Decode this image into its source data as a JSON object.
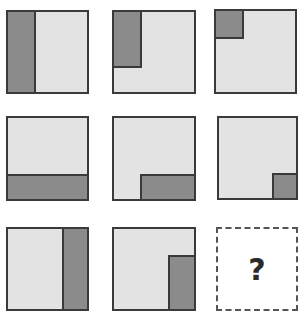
{
  "puzzle": {
    "type": "3x3 matrix reasoning",
    "colors": {
      "light": "#e3e3e3",
      "dark": "#8b8b8b",
      "border": "#3a3a3a"
    },
    "cells": [
      {
        "id": 1,
        "box": [
          6,
          10,
          83,
          84
        ],
        "shade": {
          "left": 0,
          "top": 0,
          "width": 28,
          "height": 84
        }
      },
      {
        "id": 2,
        "box": [
          112,
          10,
          84,
          84
        ],
        "shade": {
          "left": 0,
          "top": 0,
          "width": 28,
          "height": 56
        }
      },
      {
        "id": 3,
        "box": [
          214,
          9,
          83,
          85
        ],
        "shade": {
          "left": 0,
          "top": 0,
          "width": 28,
          "height": 28
        }
      },
      {
        "id": 4,
        "box": [
          6,
          116,
          83,
          85
        ],
        "shade": {
          "left": 0,
          "top": 58,
          "width": 83,
          "height": 27
        }
      },
      {
        "id": 5,
        "box": [
          112,
          116,
          84,
          85
        ],
        "shade": {
          "left": 28,
          "top": 58,
          "width": 56,
          "height": 27
        }
      },
      {
        "id": 6,
        "box": [
          217,
          116,
          81,
          84
        ],
        "shade": {
          "left": 55,
          "top": 57,
          "width": 26,
          "height": 27
        }
      },
      {
        "id": 7,
        "box": [
          6,
          227,
          83,
          84
        ],
        "shade": {
          "left": 56,
          "top": 0,
          "width": 27,
          "height": 84
        }
      },
      {
        "id": 8,
        "box": [
          112,
          227,
          84,
          84
        ],
        "shade": {
          "left": 56,
          "top": 28,
          "width": 28,
          "height": 56
        }
      }
    ],
    "answer": {
      "box": [
        216,
        227,
        82,
        84
      ],
      "label": "?"
    }
  }
}
